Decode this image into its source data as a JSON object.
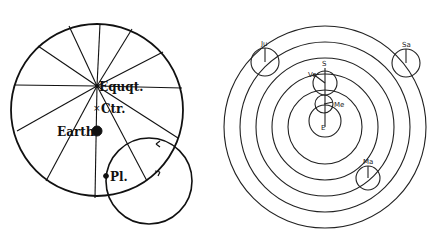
{
  "left_diagram": {
    "description": "Ptolemaic deferent with equant, center and Earth; planet on epicycle",
    "labels": {
      "equant": "Equqt.",
      "center": "Ctr.",
      "earth": "Earth",
      "planet": "Pl."
    },
    "deferent": {
      "cx": 97,
      "cy": 110,
      "r": 86
    },
    "equant_point": {
      "x": 97,
      "y": 86
    },
    "center_point": {
      "x": 97,
      "y": 107
    },
    "earth_point": {
      "x": 97,
      "y": 131
    },
    "planet_point": {
      "x": 106,
      "y": 176
    },
    "epicycle": {
      "cx": 149,
      "cy": 181,
      "r": 43
    },
    "spoke_count": 16
  },
  "right_diagram": {
    "description": "Geocentric system with nested planetary spheres and epicycles",
    "labels": {
      "earth": "E",
      "sun": "S",
      "mercury": "Me",
      "venus": "Ve",
      "mars": "Ma",
      "jupiter": "Ju",
      "saturn": "Sa"
    },
    "center": {
      "x": 325,
      "y": 127
    },
    "ring_radii": [
      101,
      85,
      69,
      53,
      37
    ],
    "inner_circle": {
      "cx": 325,
      "cy": 121,
      "r": 16
    },
    "epicycles": [
      {
        "name": "Me",
        "cx": 324,
        "cy": 104,
        "r": 9
      },
      {
        "name": "Ve",
        "cx": 325,
        "cy": 83,
        "r": 12
      },
      {
        "name": "Ju",
        "cx": 265,
        "cy": 62,
        "r": 14
      },
      {
        "name": "Sa",
        "cx": 406,
        "cy": 63,
        "r": 14
      },
      {
        "name": "Ma",
        "cx": 368,
        "cy": 178,
        "r": 12
      }
    ]
  }
}
